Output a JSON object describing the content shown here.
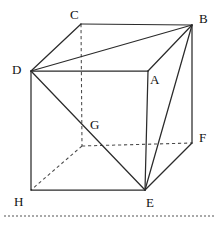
{
  "figure": {
    "kind": "geometry-diagram",
    "canvas": {
      "width": 220,
      "height": 225
    },
    "colors": {
      "background": "#ffffff",
      "solid_edge": "#2b2b2b",
      "hidden_edge": "#4a4a4a",
      "label_text": "#111111",
      "footer_rule": "#555555"
    },
    "vertices": [
      {
        "id": "A",
        "label": "A",
        "x": 148,
        "y": 71,
        "label_x": 150,
        "label_y": 73,
        "hidden": false
      },
      {
        "id": "B",
        "label": "B",
        "x": 192,
        "y": 25,
        "label_x": 199,
        "label_y": 12,
        "hidden": false
      },
      {
        "id": "C",
        "label": "C",
        "x": 81,
        "y": 24,
        "label_x": 70,
        "label_y": 8,
        "hidden": false
      },
      {
        "id": "D",
        "label": "D",
        "x": 31,
        "y": 71,
        "label_x": 12,
        "label_y": 63,
        "hidden": false
      },
      {
        "id": "E",
        "label": "E",
        "x": 145,
        "y": 190,
        "label_x": 146,
        "label_y": 196,
        "hidden": false
      },
      {
        "id": "F",
        "label": "F",
        "x": 192,
        "y": 143,
        "label_x": 199,
        "label_y": 131,
        "hidden": false
      },
      {
        "id": "G",
        "label": "G",
        "x": 82,
        "y": 146,
        "label_x": 90,
        "label_y": 118,
        "hidden": true
      },
      {
        "id": "H",
        "label": "H",
        "x": 31,
        "y": 190,
        "label_x": 14,
        "label_y": 195,
        "hidden": false
      }
    ],
    "edges_solid": [
      {
        "from": "C",
        "to": "B",
        "x1": 81,
        "y1": 24,
        "x2": 192,
        "y2": 25
      },
      {
        "from": "C",
        "to": "D",
        "x1": 81,
        "y1": 24,
        "x2": 31,
        "y2": 71
      },
      {
        "from": "D",
        "to": "B",
        "x1": 31,
        "y1": 71,
        "x2": 192,
        "y2": 25
      },
      {
        "from": "D",
        "to": "A",
        "x1": 31,
        "y1": 71,
        "x2": 148,
        "y2": 71
      },
      {
        "from": "A",
        "to": "B",
        "x1": 148,
        "y1": 71,
        "x2": 192,
        "y2": 25
      },
      {
        "from": "D",
        "to": "H",
        "x1": 31,
        "y1": 71,
        "x2": 31,
        "y2": 190
      },
      {
        "from": "A",
        "to": "E",
        "x1": 148,
        "y1": 71,
        "x2": 145,
        "y2": 190
      },
      {
        "from": "H",
        "to": "E",
        "x1": 31,
        "y1": 190,
        "x2": 145,
        "y2": 190
      },
      {
        "from": "B",
        "to": "F",
        "x1": 192,
        "y1": 25,
        "x2": 192,
        "y2": 143
      },
      {
        "from": "F",
        "to": "E",
        "x1": 192,
        "y1": 143,
        "x2": 145,
        "y2": 190
      },
      {
        "from": "B",
        "to": "E",
        "x1": 192,
        "y1": 25,
        "x2": 145,
        "y2": 190
      },
      {
        "from": "D",
        "to": "E",
        "x1": 31,
        "y1": 71,
        "x2": 145,
        "y2": 190
      }
    ],
    "edges_hidden": [
      {
        "from": "C",
        "to": "G",
        "x1": 81,
        "y1": 24,
        "x2": 82,
        "y2": 146
      },
      {
        "from": "G",
        "to": "F",
        "x1": 82,
        "y1": 146,
        "x2": 192,
        "y2": 143
      },
      {
        "from": "G",
        "to": "H",
        "x1": 82,
        "y1": 146,
        "x2": 31,
        "y2": 190
      }
    ],
    "footer_rule": {
      "x1": 4,
      "y1": 216,
      "x2": 216,
      "y2": 216
    }
  }
}
